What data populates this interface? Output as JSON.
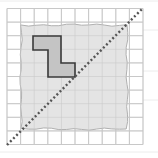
{
  "diagram": {
    "title": "Reflection of shape across diagonal line on square grid",
    "grid": {
      "columns": 10,
      "rows": 10,
      "origin_x": 7,
      "origin_y": 8.5,
      "cell_size": 13.6,
      "line_color": "#c8c8c8"
    },
    "shaded_region": {
      "description": "square shaded region with rough edges",
      "x": 21,
      "y": 25,
      "width": 106,
      "height": 104,
      "fill": "#e4e4e4",
      "stroke": "#b0b0b0"
    },
    "shape": {
      "description": "Z-shaped polygon of grid squares",
      "points": [
        [
          33,
          36
        ],
        [
          61,
          36
        ],
        [
          61,
          63
        ],
        [
          75,
          63
        ],
        [
          75,
          77
        ],
        [
          48,
          77
        ],
        [
          48,
          50
        ],
        [
          33,
          50
        ]
      ],
      "fill": "#c4c4c4",
      "stroke": "#3a3a3a"
    },
    "mirror_line": {
      "description": "dotted diagonal line of reflection",
      "x1": 7,
      "y1": 145,
      "x2": 142,
      "y2": 9,
      "color": "#555555"
    },
    "background_lines_color": "#e6e6e6"
  }
}
